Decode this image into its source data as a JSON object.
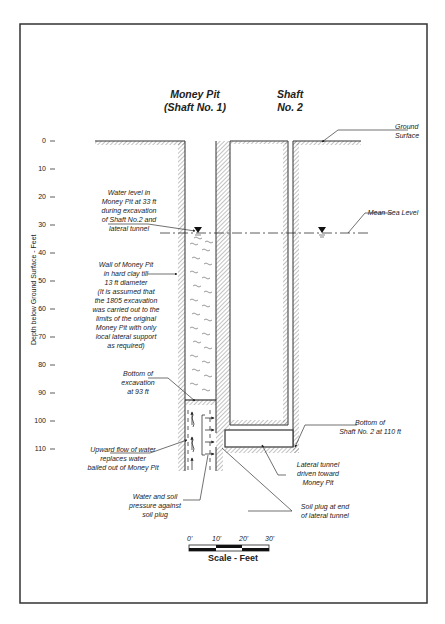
{
  "diagram": {
    "titles": {
      "money_pit": "Money Pit\n(Shaft No. 1)",
      "shaft2": "Shaft\nNo. 2"
    },
    "y_axis": {
      "label": "Depth below Ground Surface - Feet",
      "ticks": [
        "0",
        "10",
        "20",
        "30",
        "40",
        "50",
        "60",
        "70",
        "80",
        "90",
        "100",
        "110"
      ]
    },
    "annotations": {
      "ground_surface": "Ground\nSurface",
      "mean_sea_level": "Mean Sea Level",
      "water_level": "Water level in\nMoney Pit at 33 ft\nduring excavation\nof Shaft No.2 and\nlateral tunnel",
      "wall": "Wall of Money Pit\nin hard clay till\n13 ft diameter\n(It is assumed that\nthe 1805 excavation\nwas carried out to the\nlimits of the original\nMoney Pit with only\nlocal lateral support\nas required)",
      "bottom_excavation": "Bottom of\nexcavation\nat 93 ft",
      "upward_flow": "Upward flow of water\nreplaces water\nbailed out of Money Pit",
      "water_soil_pressure": "Water and soil\npressure against\nsoil plug",
      "soil_plug": "Soil plug at end\nof lateral tunnel",
      "lateral_tunnel": "Lateral tunnel\ndriven toward\nMoney Pit",
      "bottom_shaft2": "Bottom of\nShaft No. 2 at 110 ft"
    },
    "scale": {
      "ticks": [
        "0'",
        "10'",
        "20'",
        "30'"
      ],
      "title": "Scale - Feet"
    },
    "colors": {
      "line": "#333333",
      "hatch": "#555555",
      "border": "#333333"
    }
  }
}
